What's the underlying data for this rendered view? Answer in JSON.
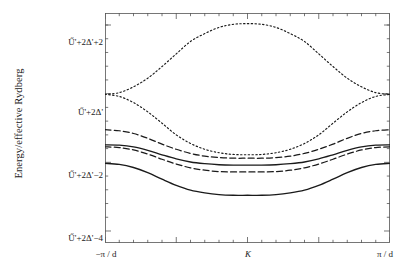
{
  "figure": {
    "background": "#ffffff",
    "ink": "#1a1a1a"
  },
  "axes": {
    "y_title": "Energy/effective Rydberg",
    "y_ticks": [
      {
        "label": "Ű'+2Δ'+2",
        "value": 2
      },
      {
        "label": "Ű'+2Δ'",
        "value": 0
      },
      {
        "label": "Ű'+2Δ'−2",
        "value": -2
      },
      {
        "label": "Ű'+2Δ'−4",
        "value": -4
      }
    ],
    "x_ticks": [
      {
        "label": "−π / d",
        "value": -1
      },
      {
        "label": "K",
        "value": 0
      },
      {
        "label": "π / d",
        "value": 1
      }
    ],
    "frame": {
      "left": 105,
      "top": 13,
      "width": 285,
      "height": 230
    },
    "minor_ticks_per_major_x": 5,
    "minor_ticks_per_major_y": 5
  },
  "chart_data": {
    "type": "line",
    "title": "",
    "xlabel": "",
    "ylabel": "Energy/effective Rydberg",
    "xlim": [
      -1,
      1
    ],
    "ylim": [
      -4.35,
      2.35
    ],
    "grid": false,
    "legend": "none",
    "x_tick_labels": [
      "−π / d",
      "K",
      "π / d"
    ],
    "y_tick_labels": [
      "Ű'+2Δ'+2",
      "Ű'+2Δ'",
      "Ű'+2Δ'−2",
      "Ű'+2Δ'−4"
    ],
    "x": [
      -1,
      -0.9,
      -0.8,
      -0.7,
      -0.6,
      -0.5,
      -0.4,
      -0.3,
      -0.2,
      -0.1,
      0,
      0.1,
      0.2,
      0.3,
      0.4,
      0.5,
      0.6,
      0.7,
      0.8,
      0.9,
      1
    ],
    "series": [
      {
        "name": "band-1-dotted-upper",
        "style": "dotted",
        "edge_value": -0.02,
        "center_value": 2.04,
        "values": [
          -0.02,
          0.03,
          0.2,
          0.45,
          0.79,
          1.16,
          1.52,
          1.75,
          1.93,
          2.02,
          2.04,
          2.02,
          1.93,
          1.75,
          1.52,
          1.16,
          0.79,
          0.45,
          0.2,
          0.03,
          -0.02
        ]
      },
      {
        "name": "band-2-dotted-lower",
        "style": "dotted",
        "edge_value": -0.02,
        "center_value": -1.78,
        "values": [
          -0.02,
          -0.08,
          -0.26,
          -0.53,
          -0.86,
          -1.2,
          -1.45,
          -1.62,
          -1.72,
          -1.77,
          -1.78,
          -1.77,
          -1.72,
          -1.62,
          -1.45,
          -1.2,
          -0.86,
          -0.53,
          -0.26,
          -0.08,
          -0.02
        ]
      },
      {
        "name": "band-3-dashed-upper",
        "style": "dashed",
        "edge_value": -1.05,
        "center_value": -1.88,
        "values": [
          -1.05,
          -1.08,
          -1.16,
          -1.3,
          -1.47,
          -1.62,
          -1.74,
          -1.82,
          -1.86,
          -1.88,
          -1.88,
          -1.88,
          -1.86,
          -1.82,
          -1.74,
          -1.62,
          -1.47,
          -1.3,
          -1.16,
          -1.08,
          -1.05
        ]
      },
      {
        "name": "band-4-solid-upper",
        "style": "solid",
        "edge_value": -1.49,
        "center_value": -2.08,
        "values": [
          -1.49,
          -1.5,
          -1.55,
          -1.65,
          -1.78,
          -1.9,
          -1.99,
          -2.04,
          -2.07,
          -2.08,
          -2.08,
          -2.08,
          -2.07,
          -2.04,
          -1.99,
          -1.9,
          -1.78,
          -1.65,
          -1.55,
          -1.5,
          -1.49
        ]
      },
      {
        "name": "band-5-dashed-lower",
        "style": "dashed",
        "edge_value": -1.55,
        "center_value": -2.28,
        "values": [
          -1.55,
          -1.57,
          -1.64,
          -1.76,
          -1.91,
          -2.05,
          -2.16,
          -2.23,
          -2.27,
          -2.28,
          -2.28,
          -2.28,
          -2.27,
          -2.23,
          -2.16,
          -2.05,
          -1.91,
          -1.76,
          -1.64,
          -1.57,
          -1.55
        ]
      },
      {
        "name": "band-6-solid-lower",
        "style": "solid",
        "edge_value": -2.03,
        "center_value": -2.96,
        "values": [
          -2.03,
          -2.06,
          -2.15,
          -2.3,
          -2.49,
          -2.67,
          -2.81,
          -2.89,
          -2.94,
          -2.96,
          -2.96,
          -2.96,
          -2.94,
          -2.89,
          -2.81,
          -2.67,
          -2.49,
          -2.3,
          -2.15,
          -2.06,
          -2.03
        ]
      }
    ]
  }
}
